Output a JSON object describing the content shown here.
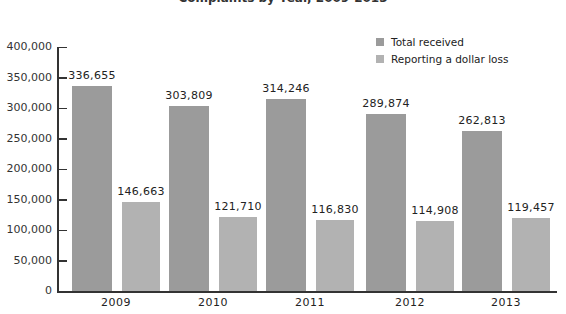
{
  "chart_data": {
    "type": "bar",
    "title": "",
    "categories": [
      "2009",
      "2010",
      "2011",
      "2012",
      "2013"
    ],
    "series": [
      {
        "name": "Total received",
        "color": "#9b9b9b",
        "values": [
          336655,
          303809,
          314246,
          289874,
          262813
        ],
        "labels": [
          "336,655",
          "303,809",
          "314,246",
          "289,874",
          "262,813"
        ]
      },
      {
        "name": "Reporting a dollar loss",
        "color": "#b2b2b2",
        "values": [
          146663,
          121710,
          116830,
          114908,
          119457
        ],
        "labels": [
          "146,663",
          "121,710",
          "116,830",
          "114,908",
          "119,457"
        ]
      }
    ],
    "xlabel": "",
    "ylabel": "",
    "ylim": [
      0,
      400000
    ],
    "yticks": [
      "0",
      "50,000",
      "100,000",
      "150,000",
      "200,000",
      "250,000",
      "300,000",
      "350,000",
      "400,000"
    ],
    "grid": false,
    "legend_position": "top-right"
  },
  "legend": {
    "total": "Total received",
    "loss": "Reporting a dollar loss"
  },
  "title_partial": "Complaints by Year, 2009-2013"
}
